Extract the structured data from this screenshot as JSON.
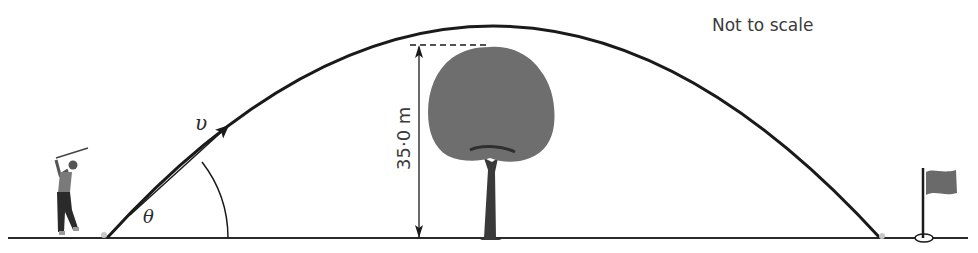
{
  "diagram": {
    "title_note": "Not to scale",
    "velocity_label": "υ",
    "angle_label": "θ",
    "height_label": "35·0 m",
    "elements": {
      "golfer": "golfer-figure",
      "ball_start": "golf-ball",
      "ball_end": "golf-ball",
      "tree": "tree",
      "flag": "golf-flag",
      "hole": "golf-hole"
    },
    "colors": {
      "line": "#1a1a1a",
      "foliage": "#6e6e6e",
      "trunk": "#3a3a3a",
      "ball": "#c8c8c8",
      "flag": "#6a6a6a"
    }
  }
}
